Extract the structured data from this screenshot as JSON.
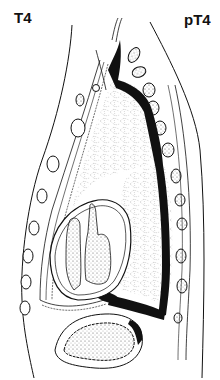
{
  "figure": {
    "label_left": "T4",
    "label_right": "pT4",
    "colors": {
      "ink": "#111111",
      "background": "#ffffff",
      "stipple": "#555555"
    },
    "icons": {
      "illustration": "sagittal-anatomy-illustration"
    }
  }
}
